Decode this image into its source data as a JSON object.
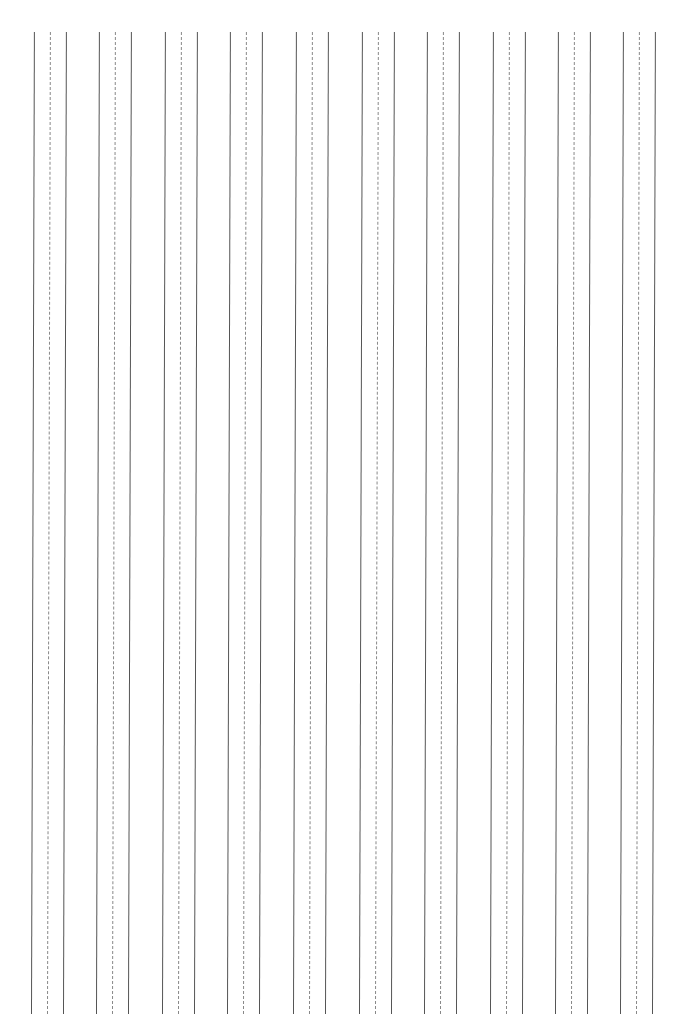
{
  "page": {
    "type": "vertical-ruled-practice-sheet",
    "background": "#ffffff",
    "line_color_solid": "#555555",
    "line_color_dashed": "#888888",
    "groups": [
      {
        "left": 34,
        "lines": [
          "solid",
          "dashed",
          "solid"
        ]
      },
      {
        "left": 99,
        "lines": [
          "solid",
          "dashed",
          "solid"
        ]
      },
      {
        "left": 165,
        "lines": [
          "solid",
          "dashed",
          "solid"
        ]
      },
      {
        "left": 230,
        "lines": [
          "solid",
          "dashed",
          "solid"
        ]
      },
      {
        "left": 296,
        "lines": [
          "solid",
          "dashed",
          "solid"
        ]
      },
      {
        "left": 362,
        "lines": [
          "solid",
          "dashed",
          "solid"
        ]
      },
      {
        "left": 427,
        "lines": [
          "solid",
          "dashed",
          "solid"
        ]
      },
      {
        "left": 493,
        "lines": [
          "solid",
          "dashed",
          "solid"
        ]
      },
      {
        "left": 558,
        "lines": [
          "solid",
          "dashed",
          "solid"
        ]
      },
      {
        "left": 623,
        "lines": [
          "solid",
          "dashed",
          "solid"
        ]
      }
    ]
  }
}
